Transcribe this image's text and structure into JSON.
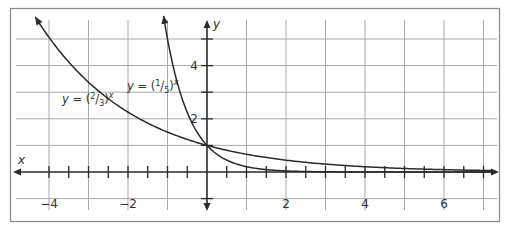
{
  "chart_data": {
    "type": "line",
    "title": "",
    "xlabel": "x",
    "ylabel": "y",
    "xlim": [
      -4.9,
      7.3
    ],
    "ylim": [
      -1.3,
      5.8
    ],
    "grid": true,
    "x_gridlines": [
      -4,
      -3,
      -2,
      -1,
      0,
      1,
      2,
      3,
      4,
      5,
      6,
      7
    ],
    "y_gridlines": [
      -1,
      0,
      1,
      2,
      3,
      4,
      5
    ],
    "x_tick_step": 0.5,
    "y_tick_step": 1,
    "x_tick_labels": [
      {
        "value": -4,
        "label": "−4"
      },
      {
        "value": -2,
        "label": "−2"
      },
      {
        "value": 2,
        "label": "2"
      },
      {
        "value": 4,
        "label": "4"
      },
      {
        "value": 6,
        "label": "6"
      }
    ],
    "y_tick_labels": [
      {
        "value": 2,
        "label": "2"
      },
      {
        "value": 4,
        "label": "4"
      }
    ],
    "series": [
      {
        "name": "y = (2/3)^x",
        "base": 0.6667,
        "x_start": -4.35,
        "x_end": 7.2,
        "label_parts": {
          "y": "y",
          "eq": " = (",
          "num": "2",
          "slash": "/",
          "den": "3",
          "close": ")",
          "exp": "x"
        },
        "label_pos": [
          62,
          103
        ],
        "values_sample": {
          "x": [
            -4,
            -3,
            -2,
            -1,
            0,
            1,
            2,
            4,
            6
          ],
          "y": [
            5.06,
            3.38,
            2.25,
            1.5,
            1,
            0.67,
            0.44,
            0.2,
            0.09
          ]
        }
      },
      {
        "name": "y = (1/5)^x",
        "base": 0.2,
        "x_start": -1.1,
        "x_end": 7.2,
        "label_parts": {
          "y": "y",
          "eq": " = (",
          "num": "1",
          "slash": "/",
          "den": "5",
          "close": ")",
          "exp": "x"
        },
        "label_pos": [
          127,
          90
        ],
        "values_sample": {
          "x": [
            -1,
            0,
            1,
            2
          ],
          "y": [
            5,
            1,
            0.2,
            0.04
          ]
        }
      }
    ],
    "annotations": [
      "y = (1/5)^x",
      "y = (2/3)^x"
    ],
    "legend": "none (inline labels)"
  }
}
